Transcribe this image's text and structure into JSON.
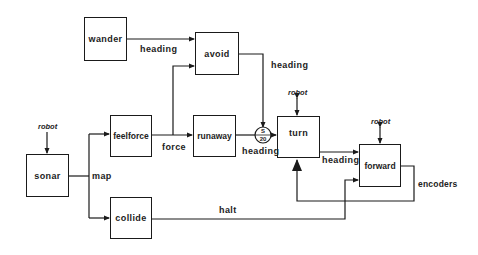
{
  "diagram": {
    "modules": {
      "wander": "wander",
      "avoid": "avoid",
      "feelforce": "feelforce",
      "runaway": "runaway",
      "turn": "turn",
      "forward": "forward",
      "sonar": "sonar",
      "collide": "collide"
    },
    "signals": {
      "wander_to_avoid": "heading",
      "avoid_to_turn": "heading",
      "feelforce_force": "force",
      "runaway_heading": "heading",
      "turn_to_forward": "heading",
      "sonar_map": "map",
      "collide_halt": "halt",
      "forward_encoders": "encoders"
    },
    "robot_labels": {
      "sonar": "robot",
      "turn": "robot",
      "forward": "robot"
    },
    "suppressor": {
      "top": "S",
      "bottom": "20"
    },
    "colors": {
      "line": "#1a1a1a",
      "background": "#ffffff",
      "text": "#222222"
    }
  }
}
